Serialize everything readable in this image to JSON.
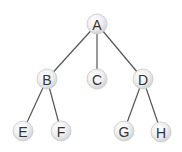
{
  "diagram": {
    "type": "tree",
    "colors": {
      "edge": "#555555",
      "node_fill_light": "#ffffff",
      "node_fill_dark": "#d4d4d4",
      "node_stroke": "#c8c8c8",
      "label": "#333333"
    },
    "nodes": [
      {
        "id": "A",
        "label": "A",
        "x": 97,
        "y": 24
      },
      {
        "id": "B",
        "label": "B",
        "x": 47,
        "y": 79
      },
      {
        "id": "C",
        "label": "C",
        "x": 97,
        "y": 79
      },
      {
        "id": "D",
        "label": "D",
        "x": 143,
        "y": 79
      },
      {
        "id": "E",
        "label": "E",
        "x": 23,
        "y": 131
      },
      {
        "id": "F",
        "label": "F",
        "x": 61,
        "y": 131
      },
      {
        "id": "G",
        "label": "G",
        "x": 124,
        "y": 131
      },
      {
        "id": "H",
        "label": "H",
        "x": 161,
        "y": 132
      }
    ],
    "edges": [
      {
        "from": "A",
        "to": "B"
      },
      {
        "from": "A",
        "to": "C"
      },
      {
        "from": "A",
        "to": "D"
      },
      {
        "from": "B",
        "to": "E"
      },
      {
        "from": "B",
        "to": "F"
      },
      {
        "from": "D",
        "to": "G"
      },
      {
        "from": "D",
        "to": "H"
      }
    ]
  }
}
